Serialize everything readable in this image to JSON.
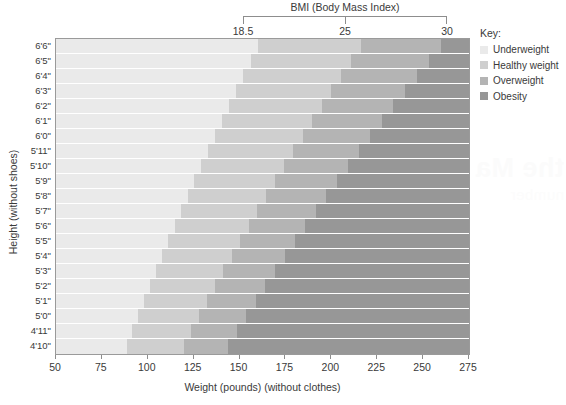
{
  "chart_data": {
    "type": "heatmap",
    "title": "BMI (Body Mass Index)",
    "xlabel": "Weight (pounds) (without clothes)",
    "ylabel": "Height (without shoes)",
    "xlim": [
      50,
      275
    ],
    "xticks": [
      50,
      75,
      100,
      125,
      150,
      175,
      200,
      225,
      250,
      275
    ],
    "xtick_labels": [
      "50",
      "75",
      "100",
      "125",
      "150",
      "175",
      "200",
      "225",
      "250",
      "275"
    ],
    "ytick_labels": [
      "6'6\"",
      "6'5\"",
      "6'4\"",
      "6'3\"",
      "6'2\"",
      "6'1\"",
      "6'0\"",
      "5'11\"",
      "5'10\"",
      "5'9\"",
      "5'8\"",
      "5'7\"",
      "5'6\"",
      "5'5\"",
      "5'4\"",
      "5'3\"",
      "5'2\"",
      "5'1\"",
      "5'0\"",
      "4'11\"",
      "4'10\""
    ],
    "heights_inches": [
      78,
      77,
      76,
      75,
      74,
      73,
      72,
      71,
      70,
      69,
      68,
      67,
      66,
      65,
      64,
      63,
      62,
      61,
      60,
      59,
      58
    ],
    "bmi_breakpoints": [
      18.5,
      25,
      30
    ],
    "bmi_bracket_labels": [
      "18.5",
      "25",
      "30"
    ],
    "grid": false,
    "legend_position": "right",
    "categories": [
      {
        "name": "Underweight",
        "bmi_range": "under 18.5",
        "color": "#eaeaea"
      },
      {
        "name": "Healthy weight",
        "bmi_range": "18.5 to 25",
        "color": "#cfcfcf"
      },
      {
        "name": "Overweight",
        "bmi_range": "25 to 30",
        "color": "#b4b4b4"
      },
      {
        "name": "Obesity",
        "bmi_range": "30 and over",
        "color": "#979797"
      }
    ]
  },
  "legend": {
    "title": "Key:",
    "items": [
      {
        "label": "Underweight",
        "color": "#eaeaea"
      },
      {
        "label": "Healthy weight",
        "color": "#cfcfcf"
      },
      {
        "label": "Overweight",
        "color": "#b4b4b4"
      },
      {
        "label": "Obesity",
        "color": "#979797"
      }
    ]
  },
  "watermark": {
    "line1": "the Ma",
    "line2": "number"
  }
}
